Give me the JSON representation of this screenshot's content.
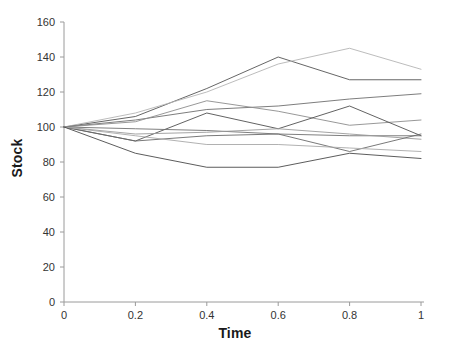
{
  "chart_data": {
    "type": "line",
    "title": "",
    "xlabel": "Time",
    "ylabel": "Stock",
    "xlim": [
      0,
      1.08
    ],
    "ylim": [
      0,
      165
    ],
    "xticks": [
      0,
      0.2,
      0.4,
      0.6,
      0.8,
      1
    ],
    "xticklabels": [
      "0",
      "0.2",
      "0.4",
      "0.6",
      "0.8",
      "1"
    ],
    "yticks": [
      0,
      20,
      40,
      60,
      80,
      100,
      120,
      140,
      160
    ],
    "yticklabels": [
      "0",
      "20",
      "40",
      "60",
      "80",
      "100",
      "120",
      "140",
      "160"
    ],
    "grid": false,
    "legend": "none",
    "x": [
      0,
      0.2,
      0.4,
      0.6,
      0.8,
      1
    ],
    "series": [
      {
        "name": "path-1",
        "color": "#555555",
        "width": 0.9,
        "values": [
          100,
          106,
          122,
          140,
          127,
          127
        ]
      },
      {
        "name": "path-2",
        "color": "#b4b4b4",
        "width": 0.9,
        "values": [
          100,
          108,
          120,
          136,
          145,
          133
        ]
      },
      {
        "name": "path-3",
        "color": "#6e6e6e",
        "width": 0.9,
        "values": [
          100,
          104,
          110,
          112,
          116,
          119
        ]
      },
      {
        "name": "path-4",
        "color": "#8c8c8c",
        "width": 0.9,
        "values": [
          100,
          103,
          115,
          109,
          101,
          104
        ]
      },
      {
        "name": "path-5",
        "color": "#505050",
        "width": 0.9,
        "values": [
          100,
          92,
          108,
          99,
          112,
          95
        ]
      },
      {
        "name": "path-6",
        "color": "#707070",
        "width": 0.9,
        "values": [
          100,
          99,
          98,
          96,
          95,
          95
        ]
      },
      {
        "name": "path-7",
        "color": "#9a9a9a",
        "width": 0.9,
        "values": [
          100,
          96,
          97,
          99,
          96,
          93
        ]
      },
      {
        "name": "path-8",
        "color": "#6a6a6a",
        "width": 0.9,
        "values": [
          100,
          92,
          95,
          96,
          86,
          96
        ]
      },
      {
        "name": "path-9",
        "color": "#a8a8a8",
        "width": 0.9,
        "values": [
          100,
          95,
          90,
          90,
          88,
          86
        ]
      },
      {
        "name": "path-10",
        "color": "#4a4a4a",
        "width": 0.9,
        "values": [
          100,
          85,
          77,
          77,
          85,
          82
        ]
      }
    ],
    "axis_color": "#9a9a9a",
    "tick_label_color": "#333333",
    "background": "#ffffff"
  },
  "caption": ""
}
